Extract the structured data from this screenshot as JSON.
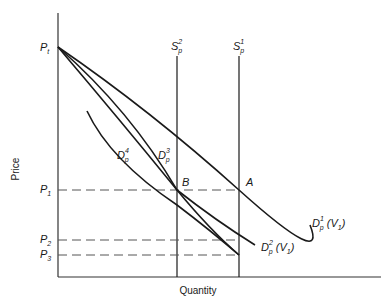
{
  "axes": {
    "y_title": "Price",
    "x_title": "Quantity"
  },
  "price_levels": {
    "pt": {
      "base": "P",
      "sub": "t"
    },
    "p1": {
      "base": "P",
      "sub": "1"
    },
    "p2": {
      "base": "P",
      "sub": "2"
    },
    "p3": {
      "base": "P",
      "sub": "3"
    }
  },
  "supply": {
    "s2": {
      "base": "S",
      "sub": "p",
      "sup": "2"
    },
    "s1": {
      "base": "S",
      "sub": "p",
      "sup": "1"
    }
  },
  "demand": {
    "d1": {
      "base": "D",
      "sub": "p",
      "sup": "1",
      "suffix": " (V",
      "suffix_sub": "1",
      "suffix_end": ")"
    },
    "d2": {
      "base": "D",
      "sub": "p",
      "sup": "2",
      "suffix": " (V",
      "suffix_sub": "1",
      "suffix_end": ")"
    },
    "d3": {
      "base": "D",
      "sub": "p",
      "sup": "3"
    },
    "d4": {
      "base": "D",
      "sub": "p",
      "sup": "4"
    }
  },
  "points": {
    "a": "A",
    "b": "B"
  },
  "colors": {
    "line": "#1a1a1a",
    "axis": "#333333",
    "dash": "#555555"
  }
}
